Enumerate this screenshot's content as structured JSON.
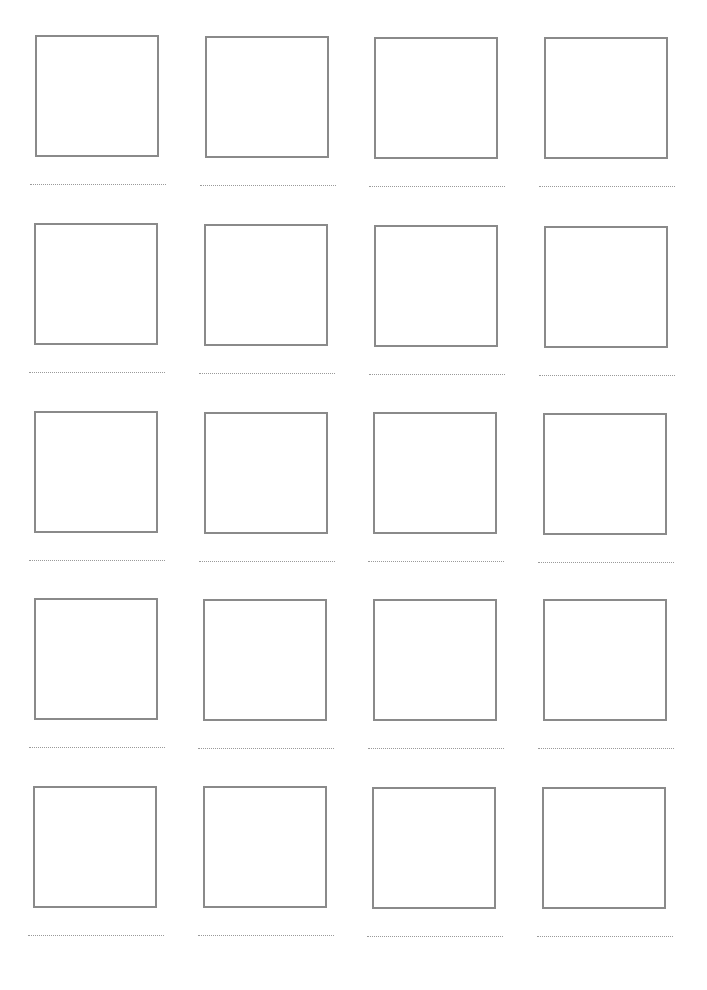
{
  "worksheet": {
    "rows": 5,
    "columns": 4,
    "cells": [
      {
        "row": 0,
        "col": 0,
        "x": 30,
        "y": 35
      },
      {
        "row": 0,
        "col": 1,
        "x": 200,
        "y": 36
      },
      {
        "row": 0,
        "col": 2,
        "x": 369,
        "y": 37
      },
      {
        "row": 0,
        "col": 3,
        "x": 539,
        "y": 37
      },
      {
        "row": 1,
        "col": 0,
        "x": 29,
        "y": 223
      },
      {
        "row": 1,
        "col": 1,
        "x": 199,
        "y": 224
      },
      {
        "row": 1,
        "col": 2,
        "x": 369,
        "y": 225
      },
      {
        "row": 1,
        "col": 3,
        "x": 539,
        "y": 226
      },
      {
        "row": 2,
        "col": 0,
        "x": 29,
        "y": 411
      },
      {
        "row": 2,
        "col": 1,
        "x": 199,
        "y": 412
      },
      {
        "row": 2,
        "col": 2,
        "x": 368,
        "y": 412
      },
      {
        "row": 2,
        "col": 3,
        "x": 538,
        "y": 413
      },
      {
        "row": 3,
        "col": 0,
        "x": 29,
        "y": 598
      },
      {
        "row": 3,
        "col": 1,
        "x": 198,
        "y": 599
      },
      {
        "row": 3,
        "col": 2,
        "x": 368,
        "y": 599
      },
      {
        "row": 3,
        "col": 3,
        "x": 538,
        "y": 599
      },
      {
        "row": 4,
        "col": 0,
        "x": 28,
        "y": 786
      },
      {
        "row": 4,
        "col": 1,
        "x": 198,
        "y": 786
      },
      {
        "row": 4,
        "col": 2,
        "x": 367,
        "y": 787
      },
      {
        "row": 4,
        "col": 3,
        "x": 537,
        "y": 787
      }
    ],
    "colors": {
      "background": "#ffffff",
      "box_border": "#8a8a8a",
      "dotted_line": "#9a9a9a"
    }
  }
}
